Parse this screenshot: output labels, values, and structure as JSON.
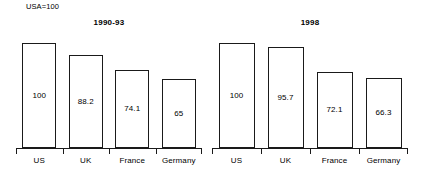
{
  "note": "USA=100",
  "chart_data": [
    {
      "type": "bar",
      "title": "1990-93",
      "xlabel": "",
      "ylabel": "",
      "ylim": [
        0,
        110
      ],
      "grid": false,
      "legend": "none",
      "categories": [
        "US",
        "UK",
        "France",
        "Germany"
      ],
      "values": [
        100,
        88.2,
        74.1,
        65
      ],
      "value_labels": [
        "100",
        "88.2",
        "74.1",
        "65"
      ],
      "annotation": "USA=100"
    },
    {
      "type": "bar",
      "title": "1998",
      "xlabel": "",
      "ylabel": "",
      "ylim": [
        0,
        110
      ],
      "grid": false,
      "legend": "none",
      "categories": [
        "US",
        "UK",
        "France",
        "Germany"
      ],
      "values": [
        100,
        95.7,
        72.1,
        66.3
      ],
      "value_labels": [
        "100",
        "95.7",
        "72.1",
        "66.3"
      ],
      "annotation": "USA=100"
    }
  ],
  "style": {
    "bar_fill": "#ffffff",
    "bar_stroke": "#1a1a1a",
    "text_color": "#000000",
    "background": "#ffffff"
  }
}
